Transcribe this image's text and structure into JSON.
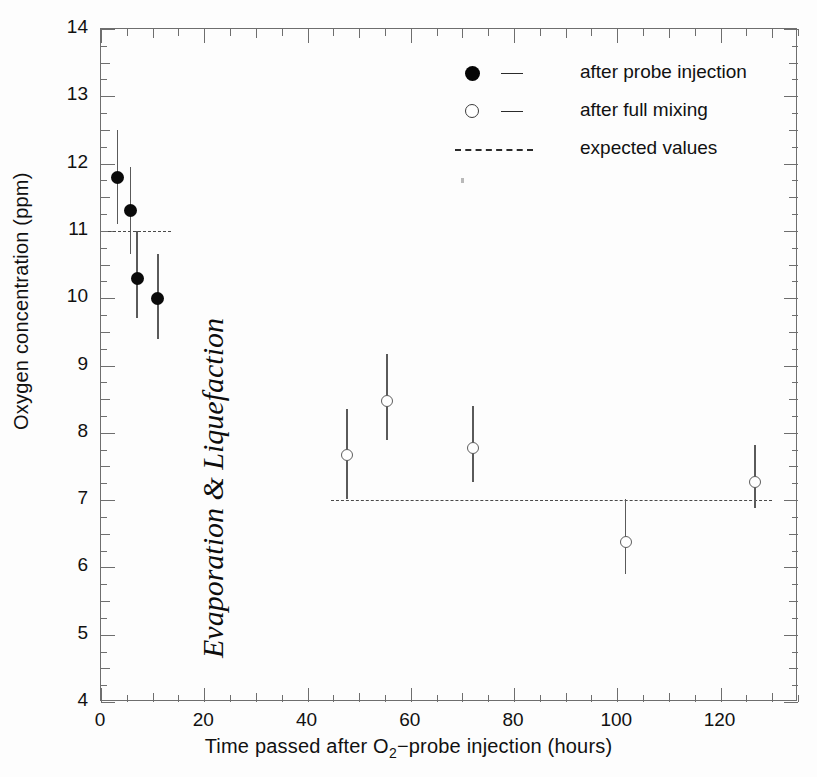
{
  "chart_data": {
    "type": "scatter",
    "title": "",
    "xlabel": "Time passed after O2-probe injection (hours)",
    "ylabel": "Oxygen concentration (ppm)",
    "xlim": [
      0,
      135
    ],
    "ylim": [
      4,
      14
    ],
    "grid": false,
    "legend_position": "top-right",
    "xticks": [
      0,
      20,
      40,
      60,
      80,
      100,
      120
    ],
    "yticks": [
      4,
      5,
      6,
      7,
      8,
      9,
      10,
      11,
      12,
      13,
      14
    ],
    "xtick_labels": [
      "0",
      "20",
      "40",
      "60",
      "80",
      "100",
      "120"
    ],
    "ytick_labels": [
      "4",
      "5",
      "6",
      "7",
      "8",
      "9",
      "10",
      "11",
      "12",
      "13",
      "14"
    ],
    "xtick_minor_step": 5,
    "ytick_minor_step": 0.25,
    "series": [
      {
        "name": "after probe injection",
        "marker": "filled-circle",
        "points": [
          {
            "x": 3.2,
            "y": 11.8,
            "yerr_low": 11.1,
            "yerr_high": 12.5
          },
          {
            "x": 5.7,
            "y": 11.3,
            "yerr_low": 10.65,
            "yerr_high": 11.95
          },
          {
            "x": 7.0,
            "y": 10.3,
            "yerr_low": 9.7,
            "yerr_high": 11.0
          },
          {
            "x": 11.0,
            "y": 10.0,
            "yerr_low": 9.4,
            "yerr_high": 10.65
          }
        ]
      },
      {
        "name": "after full mixing",
        "marker": "open-circle",
        "points": [
          {
            "x": 47.7,
            "y": 7.67,
            "yerr_low": 7.02,
            "yerr_high": 8.35
          },
          {
            "x": 55.4,
            "y": 8.47,
            "yerr_low": 7.9,
            "yerr_high": 9.17
          },
          {
            "x": 72.0,
            "y": 7.78,
            "yerr_low": 7.27,
            "yerr_high": 8.4
          },
          {
            "x": 101.6,
            "y": 6.37,
            "yerr_low": 5.9,
            "yerr_high": 7.02
          },
          {
            "x": 126.7,
            "y": 7.27,
            "yerr_low": 6.88,
            "yerr_high": 7.82
          }
        ]
      }
    ],
    "reference_lines": [
      {
        "name": "expected values",
        "y": 11.0,
        "x_start": 1.4,
        "x_end": 13.5,
        "style": "dashed"
      },
      {
        "name": "expected values",
        "y": 7.0,
        "x_start": 44.5,
        "x_end": 130.0,
        "style": "dashed"
      }
    ],
    "annotations": [
      {
        "text": "Evaporation & Liquefaction",
        "x": 20,
        "y": 8.3,
        "rotation": 90,
        "style": "italic-serif"
      }
    ]
  },
  "legend": {
    "items": [
      {
        "label": "after probe injection",
        "key": "filled-circle-dash"
      },
      {
        "label": "after full mixing",
        "key": "open-circle-dash"
      },
      {
        "label": "expected values",
        "key": "dashed-line"
      }
    ]
  },
  "axes": {
    "ylabel": "Oxygen concentration (ppm)",
    "xlabel_pre": "Time passed after O",
    "xlabel_sub": "2",
    "xlabel_post": "−probe injection (hours)"
  }
}
